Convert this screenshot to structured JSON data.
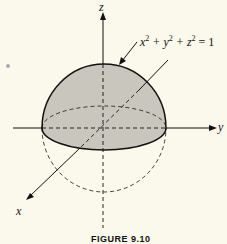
{
  "figure": {
    "equation": {
      "x": "x",
      "y": "y",
      "z": "z",
      "exp": "2",
      "rhs": "= 1"
    },
    "axes": {
      "x_label": "x",
      "y_label": "y",
      "z_label": "z"
    },
    "caption": "FIGURE 9.10",
    "colors": {
      "fill": "#c9c7bd",
      "stroke": "#111111",
      "background": "#fbf9ec"
    }
  }
}
